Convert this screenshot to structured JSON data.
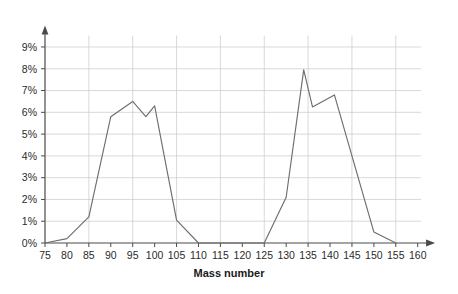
{
  "chart_data": {
    "type": "line",
    "title": "",
    "xlabel": "Mass number",
    "ylabel": "",
    "xlim": [
      75,
      163
    ],
    "ylim": [
      0,
      9.8
    ],
    "grid": true,
    "legend": "none",
    "x_ticks": [
      75,
      80,
      85,
      90,
      95,
      100,
      105,
      110,
      115,
      120,
      125,
      130,
      135,
      140,
      145,
      150,
      155,
      160
    ],
    "x_tick_labels": [
      "75",
      "80",
      "85",
      "90",
      "95",
      "100",
      "105",
      "110",
      "115",
      "120",
      "125",
      "130",
      "135",
      "140",
      "145",
      "150",
      "155",
      "160"
    ],
    "y_ticks": [
      0,
      1,
      2,
      3,
      4,
      5,
      6,
      7,
      8,
      9
    ],
    "y_tick_labels": [
      "0%",
      "1%",
      "2%",
      "3%",
      "4%",
      "5%",
      "6%",
      "7%",
      "8%",
      "9%"
    ],
    "series": [
      {
        "name": "Fission yield",
        "color": "#6e6e6e",
        "x": [
          75,
          80,
          85,
          90,
          95,
          98,
          100,
          105,
          110,
          125,
          130,
          134,
          136,
          141,
          150,
          155
        ],
        "values": [
          0.0,
          0.2,
          1.2,
          5.8,
          6.5,
          5.8,
          6.3,
          1.05,
          0.0,
          0.0,
          2.1,
          7.95,
          6.25,
          6.8,
          0.5,
          0.0
        ]
      }
    ],
    "annotations": []
  },
  "axes": {
    "x_axis_title": "Mass number"
  },
  "colors": {
    "grid": "#c9c9c9",
    "axis": "#4a4a4a",
    "line": "#6e6e6e",
    "text": "#2b2b2b",
    "background": "#ffffff"
  }
}
